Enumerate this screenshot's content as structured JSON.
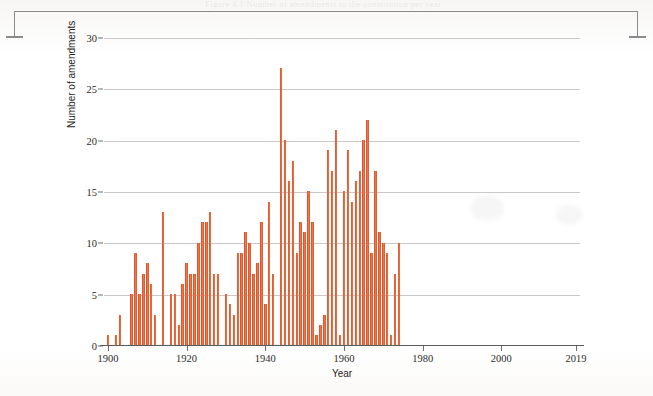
{
  "page": {
    "bleed_text_top": "Figure 4.1  Number of amendments to the constitution per year",
    "crop_bracket": "top-crop-bracket"
  },
  "chart_data": {
    "type": "bar",
    "title": "",
    "xlabel": "Year",
    "ylabel": "Number of amendments",
    "ylim": [
      0,
      30
    ],
    "yticks": [
      0,
      5,
      10,
      15,
      20,
      25,
      30
    ],
    "xticks": [
      1900,
      1920,
      1940,
      1960,
      1980,
      2000,
      2019
    ],
    "xlim": [
      1899,
      2020
    ],
    "grid": "horizontal",
    "legend": "none",
    "bar_color": "#e8552b",
    "categories": [
      1900,
      1901,
      1902,
      1903,
      1904,
      1905,
      1906,
      1907,
      1908,
      1909,
      1910,
      1911,
      1912,
      1913,
      1914,
      1915,
      1916,
      1917,
      1918,
      1919,
      1920,
      1921,
      1922,
      1923,
      1924,
      1925,
      1926,
      1927,
      1928,
      1929,
      1930,
      1931,
      1932,
      1933,
      1934,
      1935,
      1936,
      1937,
      1938,
      1939,
      1940,
      1941,
      1942,
      1943,
      1944,
      1945,
      1946,
      1947,
      1948,
      1949,
      1950,
      1951,
      1952,
      1953,
      1954,
      1955,
      1956,
      1957,
      1958,
      1959,
      1960,
      1961,
      1962,
      1963,
      1964,
      1965,
      1966,
      1967,
      1968,
      1969,
      1970,
      1971,
      1972,
      1973,
      1974,
      1975,
      1976,
      1977,
      1978,
      1979,
      1980,
      1981,
      1982,
      1983,
      1984,
      1985,
      1986,
      1987,
      1988,
      1989,
      1990,
      1991,
      1992,
      1993,
      1994,
      1995,
      1996,
      1997,
      1998,
      1999,
      2000,
      2001,
      2002,
      2003,
      2004,
      2005,
      2006,
      2007,
      2008,
      2009,
      2010,
      2011,
      2012,
      2013,
      2014,
      2015,
      2016,
      2017,
      2018,
      2019
    ],
    "values": [
      1,
      0,
      1,
      3,
      0,
      0,
      5,
      9,
      5,
      7,
      8,
      6,
      3,
      0,
      13,
      0,
      5,
      5,
      2,
      6,
      8,
      7,
      7,
      10,
      12,
      12,
      13,
      7,
      7,
      0,
      5,
      4,
      3,
      9,
      9,
      11,
      10,
      7,
      8,
      12,
      4,
      14,
      7,
      0,
      27,
      20,
      16,
      18,
      9,
      12,
      11,
      15,
      12,
      1,
      2,
      3,
      19,
      17,
      21,
      1,
      15,
      19,
      14,
      16,
      17,
      20,
      22,
      9,
      17,
      11,
      10,
      9,
      1,
      7,
      10,
      0,
      0,
      0,
      0,
      0,
      0,
      0,
      0,
      0,
      0,
      0,
      0,
      0,
      0,
      0,
      0,
      0,
      0,
      0,
      0,
      0,
      0,
      0,
      0,
      0,
      0,
      0,
      0,
      0,
      0,
      0,
      0,
      0,
      0,
      0,
      0,
      0,
      0,
      0,
      0,
      0,
      0,
      0,
      0,
      0
    ],
    "series_values_by_year": {
      "1900": 1,
      "1901": 0,
      "1902": 1,
      "1903": 3,
      "1904": 0,
      "1905": 0,
      "1906": 5,
      "1907": 9,
      "1908": 5,
      "1909": 7,
      "1910": 8,
      "1911": 6,
      "1912": 3,
      "1913": 0,
      "1914": 13,
      "1915": 0,
      "1916": 5,
      "1917": 5,
      "1918": 2,
      "1919": 6,
      "1920": 8,
      "1921": 7,
      "1922": 7,
      "1923": 10,
      "1924": 12,
      "1925": 12,
      "1926": 13,
      "1927": 7,
      "1928": 7,
      "1929": 0,
      "1930": 5,
      "1931": 4,
      "1932": 3,
      "1933": 9,
      "1934": 9,
      "1935": 11,
      "1936": 10,
      "1937": 7,
      "1938": 8,
      "1939": 12,
      "1940": 4,
      "1941": 14,
      "1942": 7,
      "1943": 0,
      "1944": 27,
      "1945": 20,
      "1946": 16,
      "1947": 18,
      "1948": 9,
      "1949": 12,
      "1950": 11,
      "1951": 15,
      "1952": 12,
      "1953": 1,
      "1954": 2,
      "1955": 3,
      "1956": 19,
      "1957": 17,
      "1958": 21,
      "1959": 1,
      "1960": 15,
      "1961": 19,
      "1962": 14,
      "1963": 16,
      "1964": 17,
      "1965": 20,
      "1966": 22,
      "1967": 9,
      "1968": 17,
      "1969": 11,
      "1970": 10,
      "1971": 9,
      "1972": 1,
      "1973": 7,
      "1974": 10
    }
  }
}
